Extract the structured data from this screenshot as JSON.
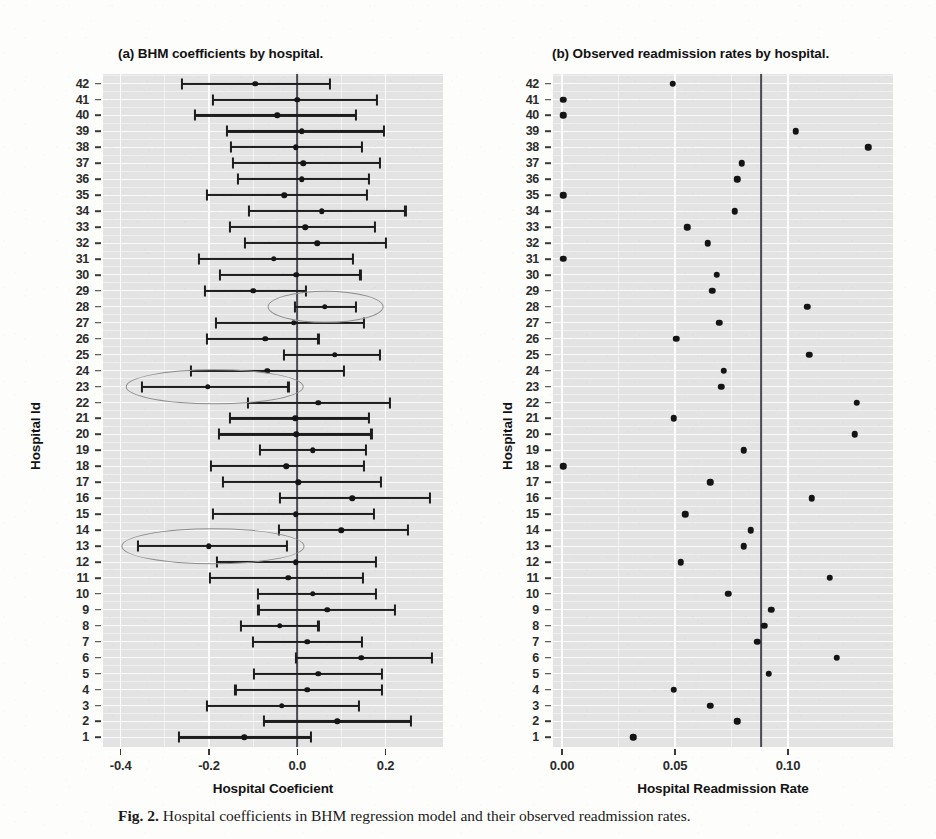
{
  "figure": {
    "caption_prefix": "Fig. 2.",
    "caption_text": "Hospital coefficients in BHM regression model and their observed readmission rates."
  },
  "panel_a": {
    "title": "(a) BHM coefficients by hospital.",
    "xlabel": "Hospital Coeficient",
    "ylabel": "Hospital  Id",
    "reference_line_value": 0.0
  },
  "panel_b": {
    "title": "(b) Observed readmission rates by hospital.",
    "xlabel": "Hospital Readmission Rate",
    "ylabel": "Hospital  Id",
    "reference_line_value": 0.088
  },
  "chart_data": [
    {
      "type": "scatter",
      "panel": "a",
      "title": "(a) BHM coefficients by hospital.",
      "xlabel": "Hospital Coeficient",
      "ylabel": "Hospital  Id",
      "xlim": [
        -0.44,
        0.33
      ],
      "ylim": [
        0.4,
        42.6
      ],
      "xticks": [
        -0.4,
        -0.2,
        0.0,
        0.2
      ],
      "xticklabels": [
        "-0.4",
        "-0.2",
        "0.0",
        "0.2"
      ],
      "yticks": [
        1,
        2,
        3,
        4,
        5,
        6,
        7,
        8,
        9,
        10,
        11,
        12,
        13,
        14,
        15,
        16,
        17,
        18,
        19,
        20,
        21,
        22,
        23,
        24,
        25,
        26,
        27,
        28,
        29,
        30,
        31,
        32,
        33,
        34,
        35,
        36,
        37,
        38,
        39,
        40,
        41,
        42
      ],
      "grid": true,
      "errorbars": true,
      "reference_lines": [
        {
          "x": 0.0,
          "style": "solid",
          "color": "#4a4a52"
        }
      ],
      "series": [
        {
          "name": "BHM coefficient (95% CI)",
          "points": [
            {
              "hospital": 42,
              "estimate": -0.095,
              "lower": -0.262,
              "upper": 0.075
            },
            {
              "hospital": 41,
              "estimate": 0.0,
              "lower": -0.192,
              "upper": 0.18
            },
            {
              "hospital": 40,
              "estimate": -0.045,
              "lower": -0.232,
              "upper": 0.133
            },
            {
              "hospital": 39,
              "estimate": 0.01,
              "lower": -0.16,
              "upper": 0.197
            },
            {
              "hospital": 38,
              "estimate": -0.003,
              "lower": -0.15,
              "upper": 0.147
            },
            {
              "hospital": 37,
              "estimate": 0.013,
              "lower": -0.146,
              "upper": 0.188
            },
            {
              "hospital": 36,
              "estimate": 0.01,
              "lower": -0.135,
              "upper": 0.163
            },
            {
              "hospital": 35,
              "estimate": -0.03,
              "lower": -0.205,
              "upper": 0.157
            },
            {
              "hospital": 34,
              "estimate": 0.055,
              "lower": -0.11,
              "upper": 0.245
            },
            {
              "hospital": 33,
              "estimate": 0.018,
              "lower": -0.152,
              "upper": 0.175
            },
            {
              "hospital": 32,
              "estimate": 0.045,
              "lower": -0.118,
              "upper": 0.2
            },
            {
              "hospital": 31,
              "estimate": -0.053,
              "lower": -0.222,
              "upper": 0.127
            },
            {
              "hospital": 30,
              "estimate": -0.002,
              "lower": -0.175,
              "upper": 0.143
            },
            {
              "hospital": 29,
              "estimate": -0.1,
              "lower": -0.21,
              "upper": 0.02
            },
            {
              "hospital": 28,
              "estimate": 0.062,
              "lower": -0.005,
              "upper": 0.133
            },
            {
              "hospital": 27,
              "estimate": -0.008,
              "lower": -0.185,
              "upper": 0.152
            },
            {
              "hospital": 26,
              "estimate": -0.072,
              "lower": -0.205,
              "upper": 0.048
            },
            {
              "hospital": 25,
              "estimate": 0.085,
              "lower": -0.03,
              "upper": 0.188
            },
            {
              "hospital": 24,
              "estimate": -0.068,
              "lower": -0.24,
              "upper": 0.105
            },
            {
              "hospital": 23,
              "estimate": -0.203,
              "lower": -0.352,
              "upper": -0.02
            },
            {
              "hospital": 22,
              "estimate": 0.048,
              "lower": -0.112,
              "upper": 0.21
            },
            {
              "hospital": 21,
              "estimate": -0.005,
              "lower": -0.152,
              "upper": 0.163
            },
            {
              "hospital": 20,
              "estimate": -0.002,
              "lower": -0.178,
              "upper": 0.168
            },
            {
              "hospital": 19,
              "estimate": 0.035,
              "lower": -0.085,
              "upper": 0.155
            },
            {
              "hospital": 18,
              "estimate": -0.025,
              "lower": -0.195,
              "upper": 0.152
            },
            {
              "hospital": 17,
              "estimate": 0.002,
              "lower": -0.168,
              "upper": 0.19
            },
            {
              "hospital": 16,
              "estimate": 0.125,
              "lower": -0.04,
              "upper": 0.3
            },
            {
              "hospital": 15,
              "estimate": -0.003,
              "lower": -0.19,
              "upper": 0.173
            },
            {
              "hospital": 14,
              "estimate": 0.1,
              "lower": -0.042,
              "upper": 0.25
            },
            {
              "hospital": 13,
              "estimate": -0.2,
              "lower": -0.36,
              "upper": -0.023
            },
            {
              "hospital": 12,
              "estimate": -0.003,
              "lower": -0.182,
              "upper": 0.178
            },
            {
              "hospital": 11,
              "estimate": -0.02,
              "lower": -0.197,
              "upper": 0.148
            },
            {
              "hospital": 10,
              "estimate": 0.035,
              "lower": -0.09,
              "upper": 0.178
            },
            {
              "hospital": 9,
              "estimate": 0.068,
              "lower": -0.088,
              "upper": 0.222
            },
            {
              "hospital": 8,
              "estimate": -0.04,
              "lower": -0.128,
              "upper": 0.048
            },
            {
              "hospital": 7,
              "estimate": 0.022,
              "lower": -0.1,
              "upper": 0.147
            },
            {
              "hospital": 6,
              "estimate": 0.145,
              "lower": -0.002,
              "upper": 0.305
            },
            {
              "hospital": 5,
              "estimate": 0.048,
              "lower": -0.098,
              "upper": 0.192
            },
            {
              "hospital": 4,
              "estimate": 0.022,
              "lower": -0.14,
              "upper": 0.192
            },
            {
              "hospital": 3,
              "estimate": -0.035,
              "lower": -0.205,
              "upper": 0.14
            },
            {
              "hospital": 2,
              "estimate": 0.09,
              "lower": -0.075,
              "upper": 0.258
            },
            {
              "hospital": 1,
              "estimate": -0.12,
              "lower": -0.268,
              "upper": 0.03
            }
          ]
        }
      ],
      "annotations": [
        {
          "type": "ellipse",
          "label": "highlight-hospital-28",
          "hospital": 28,
          "cx": 0.064,
          "cy": 28,
          "rx": 0.13,
          "ry": 0.95
        },
        {
          "type": "ellipse",
          "label": "highlight-hospital-23",
          "hospital": 23,
          "cx": -0.187,
          "cy": 23,
          "rx": 0.2,
          "ry": 1.05
        },
        {
          "type": "ellipse",
          "label": "highlight-hospital-13",
          "hospital": 13,
          "cx": -0.192,
          "cy": 13,
          "rx": 0.205,
          "ry": 1.05
        }
      ]
    },
    {
      "type": "scatter",
      "panel": "b",
      "title": "(b) Observed readmission rates by hospital.",
      "xlabel": "Hospital Readmission Rate",
      "ylabel": "Hospital  Id",
      "xlim": [
        -0.004,
        0.1465
      ],
      "ylim": [
        0.4,
        42.6
      ],
      "xticks": [
        0.0,
        0.05,
        0.1
      ],
      "xticklabels": [
        "0.00",
        "0.05",
        "0.10"
      ],
      "yticks": [
        1,
        2,
        3,
        4,
        5,
        6,
        7,
        8,
        9,
        10,
        11,
        12,
        13,
        14,
        15,
        16,
        17,
        18,
        19,
        20,
        21,
        22,
        23,
        24,
        25,
        26,
        27,
        28,
        29,
        30,
        31,
        32,
        33,
        34,
        35,
        36,
        37,
        38,
        39,
        40,
        41,
        42
      ],
      "grid": true,
      "reference_lines": [
        {
          "x": 0.088,
          "style": "solid",
          "color": "#4a4a52"
        }
      ],
      "series": [
        {
          "name": "Observed readmission rate",
          "points": [
            {
              "hospital": 42,
              "rate": 0.049
            },
            {
              "hospital": 41,
              "rate": 0.0005
            },
            {
              "hospital": 40,
              "rate": 0.0005
            },
            {
              "hospital": 39,
              "rate": 0.1035
            },
            {
              "hospital": 38,
              "rate": 0.1355
            },
            {
              "hospital": 37,
              "rate": 0.0795
            },
            {
              "hospital": 36,
              "rate": 0.0775
            },
            {
              "hospital": 35,
              "rate": 0.0005
            },
            {
              "hospital": 34,
              "rate": 0.0765
            },
            {
              "hospital": 33,
              "rate": 0.0555
            },
            {
              "hospital": 32,
              "rate": 0.0645
            },
            {
              "hospital": 31,
              "rate": 0.0005
            },
            {
              "hospital": 30,
              "rate": 0.0685
            },
            {
              "hospital": 29,
              "rate": 0.0665
            },
            {
              "hospital": 28,
              "rate": 0.1085
            },
            {
              "hospital": 27,
              "rate": 0.0695
            },
            {
              "hospital": 26,
              "rate": 0.0505
            },
            {
              "hospital": 25,
              "rate": 0.1095
            },
            {
              "hospital": 24,
              "rate": 0.0715
            },
            {
              "hospital": 23,
              "rate": 0.0705
            },
            {
              "hospital": 22,
              "rate": 0.1305
            },
            {
              "hospital": 21,
              "rate": 0.0495
            },
            {
              "hospital": 20,
              "rate": 0.1295
            },
            {
              "hospital": 19,
              "rate": 0.0805
            },
            {
              "hospital": 18,
              "rate": 0.0005
            },
            {
              "hospital": 17,
              "rate": 0.0655
            },
            {
              "hospital": 16,
              "rate": 0.1105
            },
            {
              "hospital": 15,
              "rate": 0.0545
            },
            {
              "hospital": 14,
              "rate": 0.0835
            },
            {
              "hospital": 13,
              "rate": 0.0805
            },
            {
              "hospital": 12,
              "rate": 0.0525
            },
            {
              "hospital": 11,
              "rate": 0.1185
            },
            {
              "hospital": 10,
              "rate": 0.0735
            },
            {
              "hospital": 9,
              "rate": 0.0925
            },
            {
              "hospital": 8,
              "rate": 0.0895
            },
            {
              "hospital": 7,
              "rate": 0.0865
            },
            {
              "hospital": 6,
              "rate": 0.1215
            },
            {
              "hospital": 5,
              "rate": 0.0915
            },
            {
              "hospital": 4,
              "rate": 0.0495
            },
            {
              "hospital": 3,
              "rate": 0.0655
            },
            {
              "hospital": 2,
              "rate": 0.0775
            },
            {
              "hospital": 1,
              "rate": 0.0315
            }
          ]
        }
      ]
    }
  ]
}
